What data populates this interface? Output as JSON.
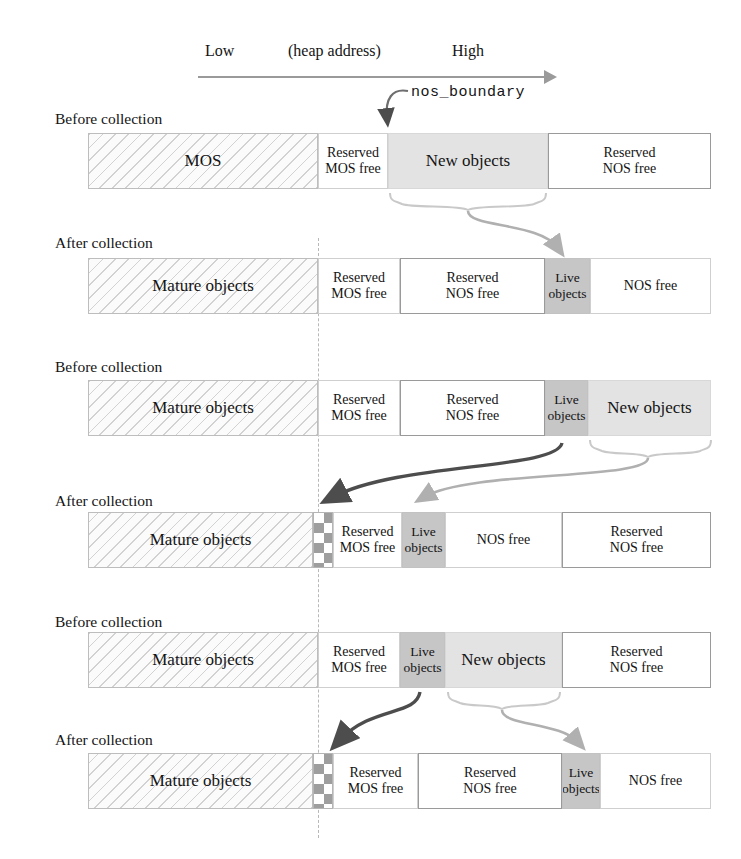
{
  "axis": {
    "low": "Low",
    "middle": "(heap address)",
    "high": "High"
  },
  "boundary_label": "nos_boundary",
  "captions": {
    "before": "Before collection",
    "after": "After collection"
  },
  "labels": {
    "mos": "MOS",
    "mature_objects": "Mature objects",
    "reserved_mos_free": "Reserved\nMOS free",
    "reserved_nos_free": "Reserved\nNOS free",
    "new_objects": "New objects",
    "live_objects": "Live\nobjects",
    "nos_free": "NOS free"
  },
  "colors": {
    "hatch_fill": "#fbfbfb",
    "hatch_line": "#d2d2d2",
    "new_objects_fill": "#e3e3e3",
    "live_objects_fill": "#c6c6c6",
    "checker_fill": "#9e9e9e",
    "plain_fill": "#ffffff",
    "border": "#bdbdbd",
    "axis": "#9a9a9a",
    "dark_arrow": "#4d4d4d",
    "light_arrow": "#b0b0b0",
    "dashed_guide": "#b8b8b8"
  },
  "rows": [
    {
      "id": "row-1",
      "caption": "Before collection",
      "caption_x": 55,
      "caption_y": 110,
      "bar_y": 133,
      "segments": [
        {
          "name": "mos",
          "style": "s-hatch",
          "x": 88,
          "w": 230,
          "text": "MOS"
        },
        {
          "name": "reserved-mos-free",
          "style": "s-plain",
          "x": 318,
          "w": 70,
          "text": "Reserved\nMOS free"
        },
        {
          "name": "new-objects",
          "style": "s-newobj",
          "x": 388,
          "w": 160,
          "text": "New objects"
        },
        {
          "name": "reserved-nos-free",
          "style": "s-boxed",
          "x": 548,
          "w": 163,
          "text": "Reserved\nNOS free"
        }
      ]
    },
    {
      "id": "row-2",
      "caption": "After collection",
      "caption_x": 55,
      "caption_y": 234,
      "bar_y": 258,
      "segments": [
        {
          "name": "mature-objects",
          "style": "s-hatch",
          "x": 88,
          "w": 230,
          "text": "Mature objects"
        },
        {
          "name": "reserved-mos-free",
          "style": "s-plain",
          "x": 318,
          "w": 82,
          "text": "Reserved\nMOS free"
        },
        {
          "name": "reserved-nos-free",
          "style": "s-boxed",
          "x": 400,
          "w": 145,
          "text": "Reserved\nNOS free"
        },
        {
          "name": "live-objects",
          "style": "s-live",
          "x": 545,
          "w": 45,
          "text": "Live\nobjects"
        },
        {
          "name": "nos-free",
          "style": "s-plain",
          "x": 590,
          "w": 121,
          "text": "NOS free"
        }
      ]
    },
    {
      "id": "row-3",
      "caption": "Before collection",
      "caption_x": 55,
      "caption_y": 358,
      "bar_y": 380,
      "segments": [
        {
          "name": "mature-objects",
          "style": "s-hatch",
          "x": 88,
          "w": 230,
          "text": "Mature objects"
        },
        {
          "name": "reserved-mos-free",
          "style": "s-plain",
          "x": 318,
          "w": 82,
          "text": "Reserved\nMOS free"
        },
        {
          "name": "reserved-nos-free",
          "style": "s-boxed",
          "x": 400,
          "w": 145,
          "text": "Reserved\nNOS free"
        },
        {
          "name": "live-objects",
          "style": "s-live",
          "x": 545,
          "w": 43,
          "text": "Live\nobjects"
        },
        {
          "name": "new-objects",
          "style": "s-newobj",
          "x": 588,
          "w": 123,
          "text": "New objects"
        }
      ]
    },
    {
      "id": "row-4",
      "caption": "After collection",
      "caption_x": 55,
      "caption_y": 492,
      "bar_y": 512,
      "segments": [
        {
          "name": "mature-objects",
          "style": "s-hatch",
          "x": 88,
          "w": 225,
          "text": "Mature objects"
        },
        {
          "name": "compacted-gap",
          "style": "s-check",
          "x": 313,
          "w": 20,
          "text": ""
        },
        {
          "name": "reserved-mos-free",
          "style": "s-plain",
          "x": 333,
          "w": 69,
          "text": "Reserved\nMOS free"
        },
        {
          "name": "live-objects",
          "style": "s-live",
          "x": 402,
          "w": 43,
          "text": "Live\nobjects"
        },
        {
          "name": "nos-free",
          "style": "s-plain",
          "x": 445,
          "w": 117,
          "text": "NOS free"
        },
        {
          "name": "reserved-nos-free",
          "style": "s-boxed",
          "x": 562,
          "w": 149,
          "text": "Reserved\nNOS free"
        }
      ]
    },
    {
      "id": "row-5",
      "caption": "Before collection",
      "caption_x": 55,
      "caption_y": 613,
      "bar_y": 632,
      "segments": [
        {
          "name": "mature-objects",
          "style": "s-hatch",
          "x": 88,
          "w": 230,
          "text": "Mature objects"
        },
        {
          "name": "reserved-mos-free",
          "style": "s-plain",
          "x": 318,
          "w": 82,
          "text": "Reserved\nMOS free"
        },
        {
          "name": "live-objects",
          "style": "s-live",
          "x": 400,
          "w": 45,
          "text": "Live\nobjects"
        },
        {
          "name": "new-objects",
          "style": "s-newobj",
          "x": 445,
          "w": 117,
          "text": "New objects"
        },
        {
          "name": "reserved-nos-free",
          "style": "s-boxed",
          "x": 562,
          "w": 149,
          "text": "Reserved\nNOS free"
        }
      ]
    },
    {
      "id": "row-6",
      "caption": "After collection",
      "caption_x": 55,
      "caption_y": 731,
      "bar_y": 753,
      "segments": [
        {
          "name": "mature-objects",
          "style": "s-hatch",
          "x": 88,
          "w": 225,
          "text": "Mature objects"
        },
        {
          "name": "compacted-gap",
          "style": "s-check",
          "x": 313,
          "w": 20,
          "text": ""
        },
        {
          "name": "reserved-mos-free",
          "style": "s-plain",
          "x": 333,
          "w": 85,
          "text": "Reserved\nMOS free"
        },
        {
          "name": "reserved-nos-free",
          "style": "s-boxed",
          "x": 418,
          "w": 144,
          "text": "Reserved\nNOS free"
        },
        {
          "name": "live-objects",
          "style": "s-live",
          "x": 562,
          "w": 38,
          "text": "Live\nobjects"
        },
        {
          "name": "nos-free",
          "style": "s-plain",
          "x": 600,
          "w": 111,
          "text": "NOS free"
        }
      ]
    }
  ]
}
